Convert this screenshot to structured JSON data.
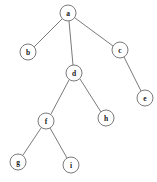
{
  "figure": {
    "type": "tree-diagram",
    "width": 157,
    "height": 182,
    "background_color": "#ffffff",
    "stroke_color": "#6b6b6b",
    "label_color": "#1a1a1a",
    "node_radius": 8
  },
  "nodes": [
    {
      "id": "a",
      "label": "a",
      "cx": 68,
      "cy": 13,
      "r": 8
    },
    {
      "id": "b",
      "label": "b",
      "cx": 28,
      "cy": 52,
      "r": 8
    },
    {
      "id": "c",
      "label": "c",
      "cx": 120,
      "cy": 50,
      "r": 8
    },
    {
      "id": "d",
      "label": "d",
      "cx": 74,
      "cy": 73,
      "r": 8
    },
    {
      "id": "e",
      "label": "e",
      "cx": 145,
      "cy": 98,
      "r": 8
    },
    {
      "id": "f",
      "label": "f",
      "cx": 46,
      "cy": 121,
      "r": 8
    },
    {
      "id": "h",
      "label": "h",
      "cx": 106,
      "cy": 118,
      "r": 8
    },
    {
      "id": "g",
      "label": "g",
      "cx": 18,
      "cy": 162,
      "r": 8
    },
    {
      "id": "i",
      "label": "i",
      "cx": 71,
      "cy": 165,
      "r": 8
    }
  ],
  "edges": [
    {
      "from": "a",
      "to": "b",
      "x1": 62,
      "y1": 19,
      "x2": 34,
      "y2": 47
    },
    {
      "from": "a",
      "to": "d",
      "x1": 69,
      "y1": 21,
      "x2": 73,
      "y2": 65
    },
    {
      "from": "a",
      "to": "c",
      "x1": 75,
      "y1": 18,
      "x2": 113,
      "y2": 46
    },
    {
      "from": "c",
      "to": "e",
      "x1": 124,
      "y1": 57,
      "x2": 141,
      "y2": 91
    },
    {
      "from": "d",
      "to": "f",
      "x1": 69,
      "y1": 80,
      "x2": 51,
      "y2": 114
    },
    {
      "from": "d",
      "to": "h",
      "x1": 80,
      "y1": 79,
      "x2": 101,
      "y2": 112
    },
    {
      "from": "f",
      "to": "g",
      "x1": 41,
      "y1": 128,
      "x2": 23,
      "y2": 155
    },
    {
      "from": "f",
      "to": "i",
      "x1": 50,
      "y1": 128,
      "x2": 67,
      "y2": 158
    }
  ]
}
